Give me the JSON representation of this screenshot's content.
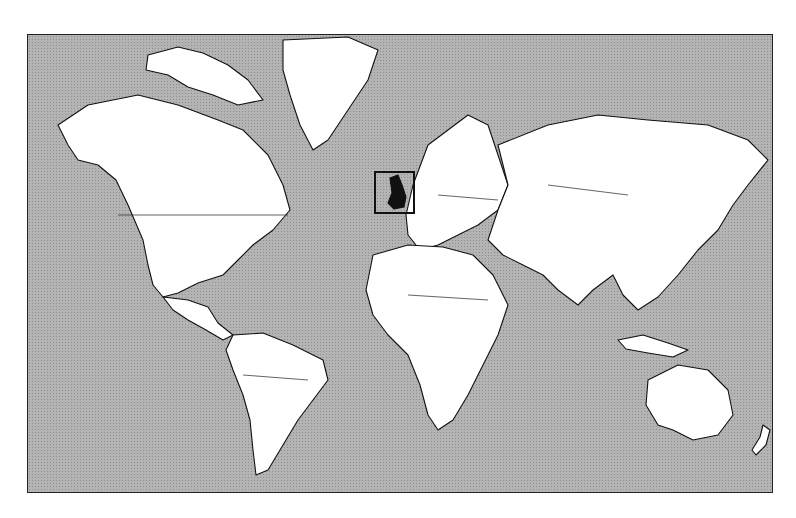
{
  "map": {
    "type": "world-political-outline",
    "projection": "mercator",
    "colors": {
      "ocean": "#b4b4b4",
      "land": "#ffffff",
      "outline": "#111111",
      "highlight": "#111111"
    },
    "highlight": {
      "region": "United Kingdom",
      "marker": "square-box"
    }
  }
}
